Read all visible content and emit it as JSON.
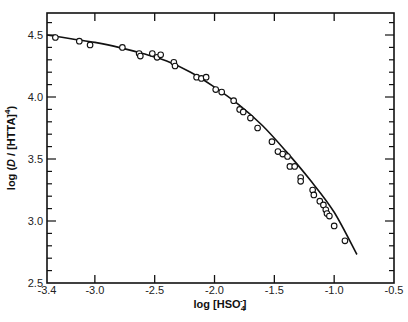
{
  "chart_data": {
    "type": "scatter",
    "title": "",
    "xlabel": "log [HSO4-]",
    "xlabel_parts": {
      "prefix": "log [HSO",
      "sub": "4",
      "sup": "-",
      "suffix": "]"
    },
    "ylabel": "log (D / [HTTA]^4)",
    "ylabel_parts": {
      "prefix": "log (",
      "italic": "D",
      "mid": " / [HTTA]",
      "sup": "4",
      "suffix": ")"
    },
    "xlim": [
      -3.4,
      -0.5
    ],
    "ylim": [
      2.5,
      4.68
    ],
    "x_ticks": [
      -3.4,
      -3.0,
      -2.5,
      -2.0,
      -1.5,
      -1.0,
      -0.5
    ],
    "x_tick_labels": [
      "-3.4",
      "-3.0",
      "-2.5",
      "-2.0",
      "-1.5",
      "-1.0",
      "-0.5"
    ],
    "y_ticks": [
      2.5,
      3.0,
      3.5,
      4.0,
      4.5
    ],
    "y_tick_labels": [
      "2.5",
      "3.0",
      "3.5",
      "4.0",
      "4.5"
    ],
    "y_minor_step": 0.1,
    "grid": false,
    "legend": null,
    "series": [
      {
        "name": "experimental",
        "style": "open-circles",
        "points": [
          [
            -3.33,
            4.48
          ],
          [
            -3.13,
            4.45
          ],
          [
            -3.04,
            4.42
          ],
          [
            -2.77,
            4.4
          ],
          [
            -2.63,
            4.35
          ],
          [
            -2.62,
            4.33
          ],
          [
            -2.52,
            4.35
          ],
          [
            -2.48,
            4.32
          ],
          [
            -2.45,
            4.34
          ],
          [
            -2.34,
            4.28
          ],
          [
            -2.33,
            4.25
          ],
          [
            -2.15,
            4.16
          ],
          [
            -2.11,
            4.15
          ],
          [
            -2.07,
            4.16
          ],
          [
            -1.99,
            4.06
          ],
          [
            -1.94,
            4.04
          ],
          [
            -1.84,
            3.97
          ],
          [
            -1.79,
            3.9
          ],
          [
            -1.76,
            3.88
          ],
          [
            -1.7,
            3.83
          ],
          [
            -1.64,
            3.75
          ],
          [
            -1.52,
            3.64
          ],
          [
            -1.47,
            3.56
          ],
          [
            -1.43,
            3.54
          ],
          [
            -1.39,
            3.52
          ],
          [
            -1.37,
            3.44
          ],
          [
            -1.33,
            3.44
          ],
          [
            -1.28,
            3.35
          ],
          [
            -1.28,
            3.32
          ],
          [
            -1.18,
            3.25
          ],
          [
            -1.17,
            3.21
          ],
          [
            -1.12,
            3.16
          ],
          [
            -1.09,
            3.13
          ],
          [
            -1.07,
            3.09
          ],
          [
            -1.06,
            3.06
          ],
          [
            -1.04,
            3.04
          ],
          [
            -1.0,
            2.96
          ],
          [
            -0.91,
            2.84
          ]
        ]
      },
      {
        "name": "fitted curve",
        "style": "solid-line",
        "points": [
          [
            -3.4,
            4.5
          ],
          [
            -3.2,
            4.47
          ],
          [
            -3.0,
            4.44
          ],
          [
            -2.8,
            4.4
          ],
          [
            -2.6,
            4.35
          ],
          [
            -2.4,
            4.29
          ],
          [
            -2.2,
            4.2
          ],
          [
            -2.0,
            4.08
          ],
          [
            -1.8,
            3.94
          ],
          [
            -1.6,
            3.77
          ],
          [
            -1.4,
            3.56
          ],
          [
            -1.2,
            3.33
          ],
          [
            -1.0,
            3.07
          ],
          [
            -0.81,
            2.73
          ]
        ]
      }
    ]
  }
}
